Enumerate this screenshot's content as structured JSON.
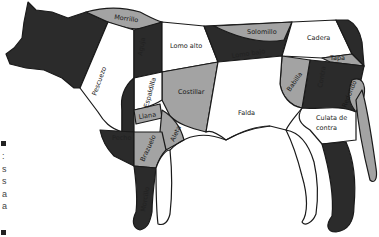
{
  "diagram": {
    "colors": {
      "dark": "#2b2b2b",
      "gray": "#a3a3a3",
      "white": "#ffffff",
      "outline": "#1a1a1a"
    },
    "cuts": [
      {
        "id": "morrillo",
        "label": "Morrillo",
        "fill": "gray"
      },
      {
        "id": "pescuezo",
        "label": "Pescuezo",
        "fill": "white"
      },
      {
        "id": "aguja",
        "label": "Aguja",
        "fill": "dark"
      },
      {
        "id": "lomo-alto",
        "label": "Lomo alto",
        "fill": "white"
      },
      {
        "id": "solomillo",
        "label": "Solomillo",
        "fill": "gray"
      },
      {
        "id": "lomo-bajo",
        "label": "Lomo bajo",
        "fill": "dark"
      },
      {
        "id": "cadera",
        "label": "Cadera",
        "fill": "white"
      },
      {
        "id": "rabo",
        "label": "Rabo",
        "fill": "dark"
      },
      {
        "id": "tapa",
        "label": "Tapa",
        "fill": "gray"
      },
      {
        "id": "babilla",
        "label": "Babilla",
        "fill": "gray"
      },
      {
        "id": "contra",
        "label": "Contra",
        "fill": "dark"
      },
      {
        "id": "redondo",
        "label": "Redondo",
        "fill": "gray"
      },
      {
        "id": "culata-de-contra",
        "label": "Culata de contra",
        "label_line1": "Culata de",
        "label_line2": "contra",
        "fill": "white"
      },
      {
        "id": "espaldilla",
        "label": "Espaldilla",
        "fill": "white"
      },
      {
        "id": "llana",
        "label": "Llana",
        "fill": "gray"
      },
      {
        "id": "costillar",
        "label": "Costillar",
        "fill": "gray"
      },
      {
        "id": "falda",
        "label": "Falda",
        "fill": "white"
      },
      {
        "id": "aleta",
        "label": "Aleta",
        "fill": "gray"
      },
      {
        "id": "pecho",
        "label": "Pecho",
        "fill": "dark"
      },
      {
        "id": "brazuelo",
        "label": "Brazuelo",
        "fill": "gray"
      },
      {
        "id": "morcillo-delantero",
        "label": "Morcillo",
        "fill": "dark"
      },
      {
        "id": "morcillo-trasero",
        "label": "Morcillo",
        "fill": "dark"
      },
      {
        "id": "cabeza",
        "label": "",
        "fill": "dark"
      }
    ]
  },
  "edge_fragment": {
    "chars": [
      ":",
      "s",
      "s",
      "a",
      "a"
    ]
  }
}
